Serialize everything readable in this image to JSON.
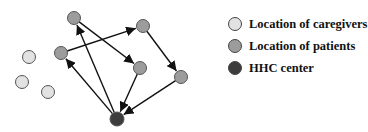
{
  "legend": {
    "items": [
      {
        "label": "Location of caregivers",
        "color": "#e2e2e2"
      },
      {
        "label": "Location of patients",
        "color": "#9c9c9c"
      },
      {
        "label": "HHC center",
        "color": "#3c3c3c"
      }
    ]
  },
  "diagram": {
    "nodes": [
      {
        "id": "p1",
        "type": "patient",
        "x": 74,
        "y": 18
      },
      {
        "id": "p2",
        "type": "patient",
        "x": 143,
        "y": 26
      },
      {
        "id": "p3",
        "type": "patient",
        "x": 61,
        "y": 53
      },
      {
        "id": "p4",
        "type": "patient",
        "x": 140,
        "y": 68
      },
      {
        "id": "p5",
        "type": "patient",
        "x": 181,
        "y": 77
      },
      {
        "id": "hhc",
        "type": "center",
        "x": 117,
        "y": 119
      },
      {
        "id": "c1",
        "type": "caregiver",
        "x": 29,
        "y": 57
      },
      {
        "id": "c2",
        "type": "caregiver",
        "x": 22,
        "y": 82
      },
      {
        "id": "c3",
        "type": "caregiver",
        "x": 48,
        "y": 92
      }
    ],
    "edges": [
      {
        "from": "hhc",
        "to": "p1"
      },
      {
        "from": "hhc",
        "to": "p3"
      },
      {
        "from": "p3",
        "to": "p2"
      },
      {
        "from": "p1",
        "to": "p4"
      },
      {
        "from": "p2",
        "to": "p5"
      },
      {
        "from": "p4",
        "to": "hhc"
      },
      {
        "from": "p5",
        "to": "hhc"
      }
    ]
  }
}
